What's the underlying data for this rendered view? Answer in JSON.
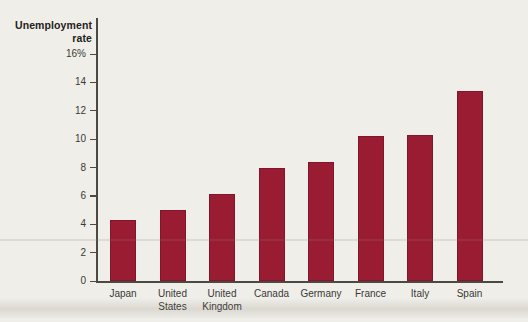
{
  "chart_data": {
    "type": "bar",
    "title": "Unemployment rate",
    "ylabel_lines": [
      "Unemployment",
      "rate"
    ],
    "xlabel": "",
    "categories": [
      "Japan",
      "United\nStates",
      "United\nKingdom",
      "Canada",
      "Germany",
      "France",
      "Italy",
      "Spain"
    ],
    "values": [
      4.3,
      5.0,
      6.1,
      8.0,
      8.4,
      10.2,
      10.3,
      13.4
    ],
    "unit": "%",
    "ylim": [
      0,
      16
    ],
    "y_ticks": [
      0,
      2,
      4,
      6,
      8,
      10,
      12,
      14,
      16
    ],
    "y_tick_labels": [
      "0",
      "2",
      "4",
      "6",
      "8",
      "10",
      "12",
      "14",
      "16%"
    ],
    "grid": false,
    "legend": "none",
    "bar_color": "#9a1c33",
    "axis_color": "#4c4842",
    "text_color": "#33322f",
    "background_color": "#f0eee9"
  }
}
